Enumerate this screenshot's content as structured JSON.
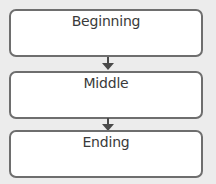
{
  "diagram": {
    "type": "flowchart",
    "direction": "top-to-bottom",
    "nodes": [
      {
        "label": "Beginning"
      },
      {
        "label": "Middle"
      },
      {
        "label": "Ending"
      }
    ],
    "edges": [
      {
        "from": "Beginning",
        "to": "Middle",
        "icon": "arrow-down-icon"
      },
      {
        "from": "Middle",
        "to": "Ending",
        "icon": "arrow-down-icon"
      }
    ],
    "colors": {
      "background": "#ececec",
      "box_fill": "#ffffff",
      "box_border": "#6e6e6e",
      "arrow": "#4a4a4a",
      "text": "#3a3a3a"
    }
  }
}
